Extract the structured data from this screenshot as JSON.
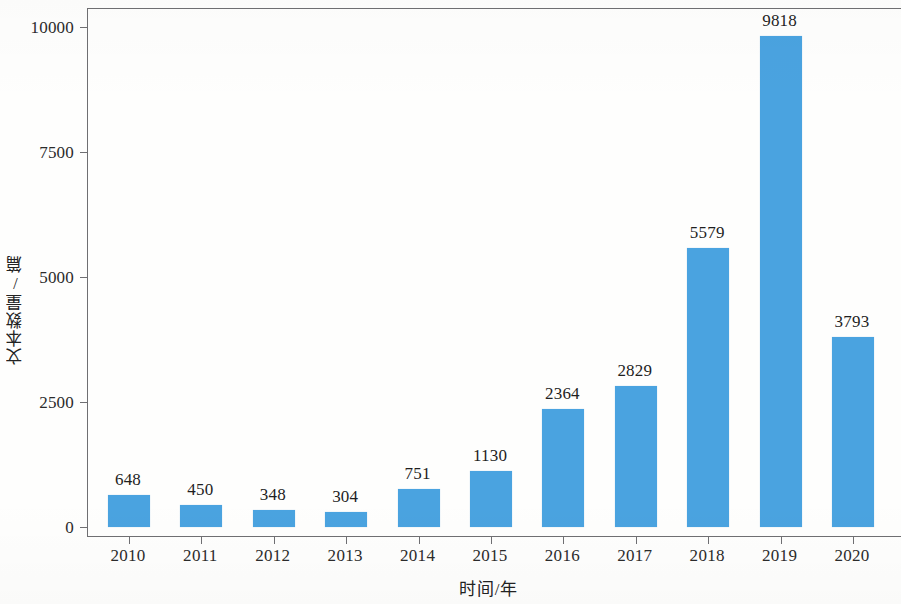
{
  "chart_data": {
    "type": "bar",
    "title": "",
    "xlabel": "时间/年",
    "ylabel": "文本数量/篇",
    "categories": [
      "2010",
      "2011",
      "2012",
      "2013",
      "2014",
      "2015",
      "2016",
      "2017",
      "2018",
      "2019",
      "2020"
    ],
    "values": [
      648,
      450,
      348,
      304,
      751,
      1130,
      2364,
      2829,
      5579,
      9818,
      3793
    ],
    "value_labels": [
      "648",
      "450",
      "348",
      "304",
      "751",
      "1130",
      "2364",
      "2829",
      "5579",
      "9818",
      "3793"
    ],
    "ylim": [
      0,
      10000
    ],
    "y_ticks": [
      0,
      2500,
      5000,
      7500,
      10000
    ],
    "y_tick_labels": [
      "0",
      "2500",
      "5000",
      "7500",
      "10000"
    ],
    "grid": false,
    "legend": null,
    "bar_color": "#4aa3e0",
    "axis_color": "#6f6f72",
    "text_color": "#2b2b2b",
    "background_color": "#fefefd"
  }
}
